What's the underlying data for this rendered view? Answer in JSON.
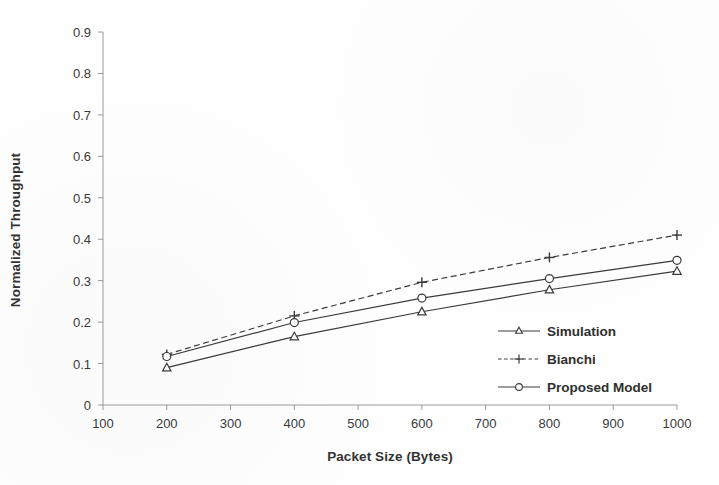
{
  "chart_data": {
    "type": "line",
    "title": "",
    "xlabel": "Packet Size (Bytes)",
    "ylabel": "Normalized Throughput",
    "x": [
      200,
      400,
      600,
      800,
      1000
    ],
    "xlim": [
      100,
      1000
    ],
    "ylim": [
      0,
      0.9
    ],
    "xticks": [
      100,
      200,
      300,
      400,
      500,
      600,
      700,
      800,
      900,
      1000
    ],
    "yticks": [
      0,
      0.1,
      0.2,
      0.3,
      0.4,
      0.5,
      0.6,
      0.7,
      0.8,
      0.9
    ],
    "xtick_labels": [
      "100",
      "200",
      "300",
      "400",
      "500",
      "600",
      "700",
      "800",
      "900",
      "1000"
    ],
    "ytick_labels": [
      "0",
      "0.1",
      "0.2",
      "0.3",
      "0.4",
      "0.5",
      "0.6",
      "0.7",
      "0.8",
      "0.9"
    ],
    "grid": false,
    "legend_position": "inside-lower-right",
    "series": [
      {
        "name": "Simulation",
        "marker": "triangle",
        "line_style": "solid",
        "color": "#3a3a3a",
        "values": [
          0.09,
          0.165,
          0.225,
          0.278,
          0.323
        ]
      },
      {
        "name": "Bianchi",
        "marker": "plus",
        "line_style": "dashed",
        "color": "#3a3a3a",
        "values": [
          0.122,
          0.215,
          0.296,
          0.356,
          0.41
        ]
      },
      {
        "name": "Proposed Model",
        "marker": "circle",
        "line_style": "solid",
        "color": "#3a3a3a",
        "values": [
          0.117,
          0.199,
          0.258,
          0.305,
          0.349
        ]
      }
    ]
  },
  "axes": {
    "axis_color": "#9a9a9a",
    "tick_color": "#9a9a9a"
  },
  "legend": {
    "items": [
      {
        "label": "Simulation"
      },
      {
        "label": "Bianchi"
      },
      {
        "label": "Proposed Model"
      }
    ]
  }
}
